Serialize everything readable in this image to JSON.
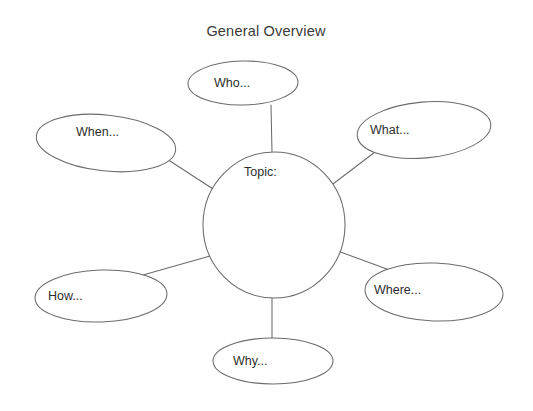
{
  "diagram": {
    "title": "General Overview",
    "type": "bubble-map",
    "center": {
      "label": "Topic:",
      "shape": "ellipse",
      "cx": 274,
      "cy": 225,
      "rx": 71,
      "ry": 73,
      "text_x": 244,
      "text_y": 173
    },
    "branches": [
      {
        "id": "who",
        "label": "Who...",
        "shape": "ellipse",
        "cx": 243,
        "cy": 83,
        "rx": 55,
        "ry": 22,
        "rotation": -1,
        "text_x": 214,
        "text_y": 84,
        "connector": {
          "x1": 271,
          "y1": 105,
          "x2": 272,
          "y2": 153
        }
      },
      {
        "id": "what",
        "label": "What...",
        "shape": "ellipse",
        "cx": 424,
        "cy": 130,
        "rx": 67,
        "ry": 28,
        "rotation": -5,
        "text_x": 370,
        "text_y": 131,
        "connector": {
          "x1": 375,
          "y1": 152,
          "x2": 333,
          "y2": 184
        }
      },
      {
        "id": "where",
        "label": "Where...",
        "shape": "ellipse",
        "cx": 434,
        "cy": 292,
        "rx": 69,
        "ry": 29,
        "rotation": 2,
        "text_x": 374,
        "text_y": 291,
        "connector": {
          "x1": 395,
          "y1": 272,
          "x2": 335,
          "y2": 250
        }
      },
      {
        "id": "why",
        "label": "Why...",
        "shape": "ellipse",
        "cx": 273,
        "cy": 361,
        "rx": 60,
        "ry": 23,
        "rotation": 0,
        "text_x": 233,
        "text_y": 362,
        "connector": {
          "x1": 272,
          "y1": 298,
          "x2": 272,
          "y2": 339
        }
      },
      {
        "id": "how",
        "label": "How...",
        "shape": "ellipse",
        "cx": 101,
        "cy": 296,
        "rx": 66,
        "ry": 26,
        "rotation": -2,
        "text_x": 48,
        "text_y": 297,
        "connector": {
          "x1": 143,
          "y1": 275,
          "x2": 210,
          "y2": 256
        }
      },
      {
        "id": "when",
        "label": "When...",
        "shape": "ellipse",
        "cx": 106,
        "cy": 143,
        "rx": 70,
        "ry": 28,
        "rotation": 6,
        "text_x": 76,
        "text_y": 133,
        "connector": {
          "x1": 167,
          "y1": 159,
          "x2": 213,
          "y2": 189
        }
      }
    ]
  },
  "colors": {
    "stroke": "#6b6b6b",
    "text": "#2e2e2e",
    "title": "#3a3a3a",
    "background": "#ffffff"
  }
}
